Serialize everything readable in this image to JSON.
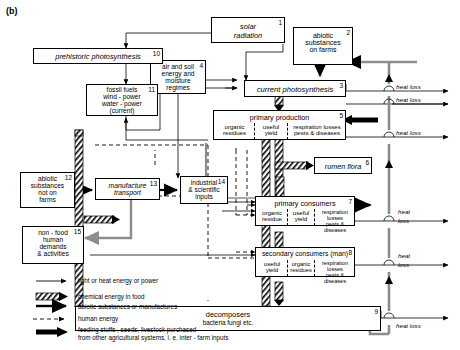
{
  "figure": {
    "label": "(b)"
  },
  "boxes": [
    {
      "id": "solar",
      "num": "1",
      "lines": [
        "solar",
        "radiation"
      ],
      "italic": true
    },
    {
      "id": "abiotic_farms",
      "num": "2",
      "lines": [
        "abiotic",
        "substances",
        "on farms"
      ],
      "italic": false
    },
    {
      "id": "current_ps",
      "num": "3",
      "lines": [
        "current photosynthesis"
      ],
      "italic": true
    },
    {
      "id": "air_soil",
      "num": "4",
      "lines": [
        "air and soil",
        "energy and",
        "moisture",
        "regimes"
      ],
      "italic": false
    },
    {
      "id": "primary_production",
      "num": "5",
      "title": "primary production",
      "cells": [
        [
          "organic",
          "residues"
        ],
        [
          "useful",
          "yield"
        ],
        [
          "respiration losses",
          "pests & diseases"
        ]
      ]
    },
    {
      "id": "rumen",
      "num": "6",
      "lines": [
        "rumen flora"
      ],
      "italic": true
    },
    {
      "id": "primary_consumers",
      "num": "7",
      "title": "primary consumers",
      "cells": [
        [
          "organic",
          "residue"
        ],
        [
          "useful",
          "yield"
        ],
        [
          "respiration losses",
          "pests & diseases"
        ]
      ]
    },
    {
      "id": "secondary_consumers",
      "num": "8",
      "title": "secondary consumers (man)",
      "cells": [
        [
          "useful",
          "yield"
        ],
        [
          "organic",
          "residues"
        ],
        [
          "respiration losses",
          "pests & diseases"
        ]
      ]
    },
    {
      "id": "decomposers",
      "num": "9",
      "title": "decomposers",
      "subtitle": "bacteria fungi etc."
    },
    {
      "id": "prehistoric_ps",
      "num": "10",
      "lines": [
        "prehistoric photosynthesis"
      ],
      "italic": true
    },
    {
      "id": "fossil_fuels",
      "num": "11",
      "lines": [
        "fossil fuels",
        "wind - power",
        "water - power",
        "(current)"
      ],
      "italic": false
    },
    {
      "id": "abiotic_not_farms",
      "num": "12",
      "lines": [
        "abiotic",
        "substances",
        "not on",
        "farms"
      ],
      "italic": false
    },
    {
      "id": "manufacture",
      "num": "13",
      "lines": [
        "manufacture",
        "transport"
      ],
      "italic": true
    },
    {
      "id": "industrial",
      "num": "14",
      "lines": [
        "industrial",
        "& scientific",
        "inputs"
      ],
      "italic": false
    },
    {
      "id": "non_food",
      "num": "15",
      "lines": [
        "non - food",
        "human",
        "demands",
        "& activities"
      ],
      "italic": false
    }
  ],
  "heat_losses": [
    {
      "id": "hl1",
      "text": "heat loss"
    },
    {
      "id": "hl2",
      "text": "heat loss"
    },
    {
      "id": "hl3",
      "text": "heat loss"
    },
    {
      "id": "hl4a",
      "text": "heat"
    },
    {
      "id": "hl4b",
      "text": "loss"
    },
    {
      "id": "hl5a",
      "text": "heat"
    },
    {
      "id": "hl5b",
      "text": "loss"
    },
    {
      "id": "hl6",
      "text": "heat loss"
    }
  ],
  "legend": {
    "items": [
      {
        "key": "light-heat",
        "symbol": "thin-arrow",
        "text": "light or heat energy or power"
      },
      {
        "key": "chemical",
        "symbol": "hatched-arrow",
        "text": "chemical energy in food"
      },
      {
        "key": "abiotic",
        "symbol": "double-arrow",
        "text": "abiotic substances or manufactures"
      },
      {
        "key": "human",
        "symbol": "dashed-arrow",
        "text": "human energy"
      },
      {
        "key": "feeding",
        "symbol": "solid-block-arrow",
        "text": "feeding stuffs , seeds, livestock purchased",
        "text2": "from other agricultural systems, i. e. inter - farm inputs"
      }
    ]
  },
  "colors": {
    "stroke": "#000000",
    "fill": "#ffffff",
    "grey": "#8c8c8c"
  }
}
